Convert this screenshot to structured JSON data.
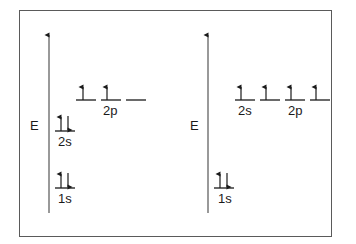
{
  "diagram": {
    "type": "orbital-energy-diagram",
    "colors": {
      "line": "#1a1a1a",
      "axis": "#555555",
      "frame": "#5a5a5a",
      "background": "#ffffff"
    },
    "panels": [
      {
        "name": "ground-state",
        "axis_label": "E",
        "orbitals": [
          {
            "label": "1s",
            "boxes": [
              [
                "up",
                "down"
              ]
            ]
          },
          {
            "label": "2s",
            "boxes": [
              [
                "up",
                "down"
              ]
            ]
          },
          {
            "label": "2p",
            "boxes": [
              [
                "up"
              ],
              [
                "up"
              ],
              []
            ]
          }
        ]
      },
      {
        "name": "promoted-state",
        "axis_label": "E",
        "orbitals": [
          {
            "label": "1s",
            "boxes": [
              [
                "up",
                "down"
              ]
            ]
          },
          {
            "label": "2s",
            "boxes": [
              [
                "up"
              ]
            ]
          },
          {
            "label": "2p",
            "boxes": [
              [
                "up"
              ],
              [
                "up"
              ],
              [
                "up"
              ]
            ]
          }
        ]
      }
    ]
  }
}
